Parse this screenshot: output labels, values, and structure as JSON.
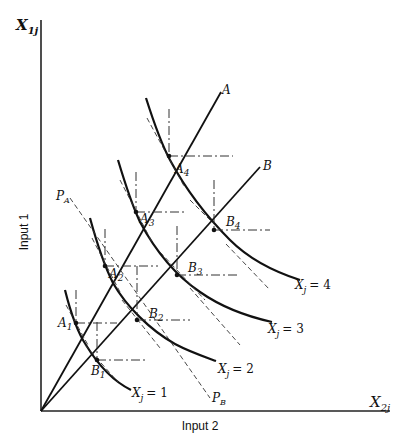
{
  "diagram": {
    "type": "isoquant-expansion-path",
    "axes": {
      "y_symbol": "X",
      "y_subscript": "1j",
      "y_label": "Input 1",
      "x_symbol": "X",
      "x_subscript": "2j",
      "x_label": "Input 2"
    },
    "rays": [
      {
        "id": "A",
        "label": "A"
      },
      {
        "id": "B",
        "label": "B"
      }
    ],
    "price_lines": [
      {
        "id": "PA",
        "label": "P",
        "subscript": "A"
      },
      {
        "id": "PB",
        "label": "P",
        "subscript": "B"
      }
    ],
    "isoquants": [
      {
        "label": "X",
        "subscript": "j",
        "eq": "= 1"
      },
      {
        "label": "X",
        "subscript": "j",
        "eq": "= 2"
      },
      {
        "label": "X",
        "subscript": "j",
        "eq": "= 3"
      },
      {
        "label": "X",
        "subscript": "j",
        "eq": "= 4"
      }
    ],
    "points_a": [
      {
        "label": "A",
        "subscript": "1"
      },
      {
        "label": "A",
        "subscript": "2"
      },
      {
        "label": "A",
        "subscript": "3"
      },
      {
        "label": "A",
        "subscript": "4"
      }
    ],
    "points_b": [
      {
        "label": "B",
        "subscript": "1"
      },
      {
        "label": "B",
        "subscript": "2"
      },
      {
        "label": "B",
        "subscript": "3"
      },
      {
        "label": "B",
        "subscript": "4"
      }
    ]
  }
}
